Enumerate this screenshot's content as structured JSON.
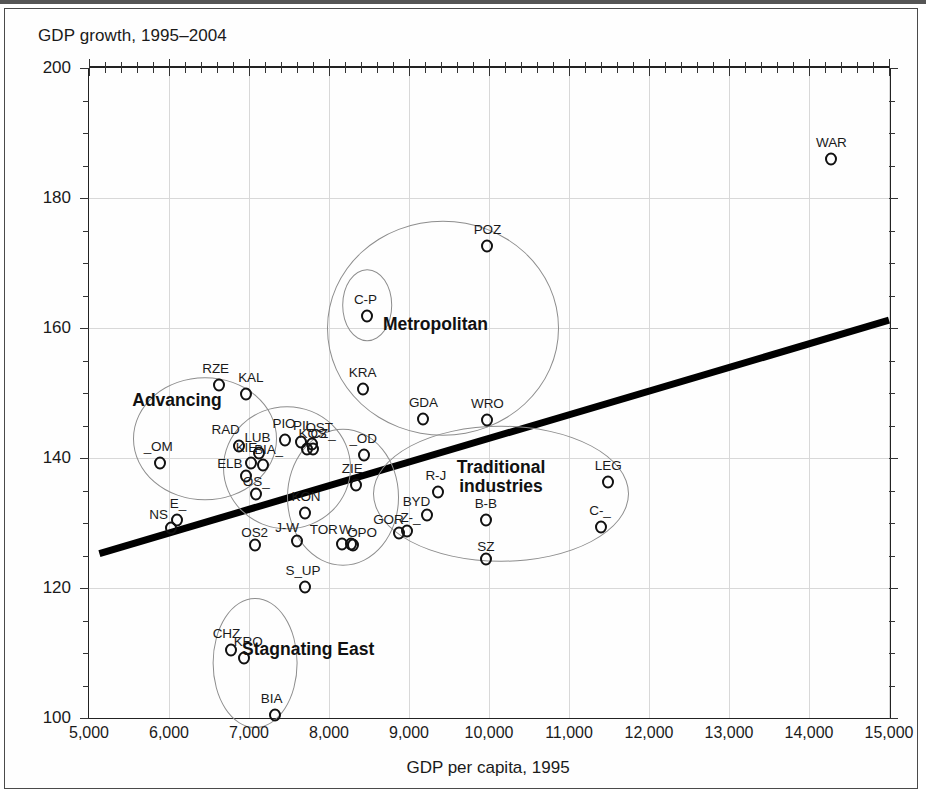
{
  "chart_data": {
    "type": "scatter",
    "title": "GDP growth, 1995–2004",
    "xlabel": "GDP per capita, 1995",
    "ylabel": "GDP growth, 1995–2004",
    "xlim": [
      5000,
      15000
    ],
    "ylim": [
      100,
      200
    ],
    "x_ticks": [
      5000,
      6000,
      7000,
      8000,
      9000,
      10000,
      11000,
      12000,
      13000,
      14000,
      15000
    ],
    "x_tick_labels": [
      "5,000",
      "6,000",
      "7,000",
      "8,000",
      "9,000",
      "10,000",
      "11,000",
      "12,000",
      "13,000",
      "14,000",
      "15,000"
    ],
    "y_ticks": [
      100,
      120,
      140,
      160,
      180,
      200
    ],
    "y_tick_labels": [
      "100",
      "120",
      "140",
      "160",
      "180",
      "200"
    ],
    "x_minor_step": 200,
    "y_minor_step": 5,
    "grid": true,
    "legend": "none",
    "point_color": "#111111",
    "cluster_color": "#8d8d8d",
    "trend_color": "#000000",
    "points": [
      {
        "label": "WAR",
        "x": 14280,
        "y": 186.0,
        "label_dx": 0,
        "label_dy": -9
      },
      {
        "label": "POZ",
        "x": 9980,
        "y": 172.6,
        "label_dx": 0,
        "label_dy": -9
      },
      {
        "label": "C-P",
        "x": 8480,
        "y": 161.8,
        "label_dx": -2,
        "label_dy": -9
      },
      {
        "label": "KRA",
        "x": 8420,
        "y": 150.6,
        "label_dx": 0,
        "label_dy": -9
      },
      {
        "label": "RZE",
        "x": 6620,
        "y": 151.2,
        "label_dx": -3,
        "label_dy": -9
      },
      {
        "label": "KAL",
        "x": 6960,
        "y": 149.8,
        "label_dx": 5,
        "label_dy": -9
      },
      {
        "label": "GDA",
        "x": 9180,
        "y": 146.0,
        "label_dx": 0,
        "label_dy": -9
      },
      {
        "label": "WRO",
        "x": 9980,
        "y": 145.8,
        "label_dx": 0,
        "label_dy": -9
      },
      {
        "label": "RAD",
        "x": 6870,
        "y": 141.8,
        "label_dx": -13,
        "label_dy": -9
      },
      {
        "label": "PIO",
        "x": 7450,
        "y": 142.7,
        "label_dx": -1,
        "label_dy": -9
      },
      {
        "label": "PIL",
        "x": 7650,
        "y": 142.4,
        "label_dx": 2,
        "label_dy": -9
      },
      {
        "label": "OST",
        "x": 7790,
        "y": 142.2,
        "label_dx": 7,
        "label_dy": -9
      },
      {
        "label": "KOS",
        "x": 7720,
        "y": 141.4,
        "label_dx": 6,
        "label_dy": -8
      },
      {
        "label": "CZ_",
        "x": 7800,
        "y": 141.4,
        "label_dx": 10,
        "label_dy": -8
      },
      {
        "label": "_OD",
        "x": 8440,
        "y": 140.4,
        "label_dx": -1,
        "label_dy": -9
      },
      {
        "label": "LUB",
        "x": 7130,
        "y": 140.7,
        "label_dx": -2,
        "label_dy": -8
      },
      {
        "label": "KIE",
        "x": 7030,
        "y": 139.2,
        "label_dx": -5,
        "label_dy": -8
      },
      {
        "label": "BIA_",
        "x": 7170,
        "y": 139.0,
        "label_dx": 6,
        "label_dy": -8
      },
      {
        "label": "_OM",
        "x": 5890,
        "y": 139.3,
        "label_dx": -2,
        "label_dy": -9
      },
      {
        "label": "LEG",
        "x": 11490,
        "y": 136.3,
        "label_dx": 0,
        "label_dy": -9
      },
      {
        "label": "ELB",
        "x": 6960,
        "y": 137.2,
        "label_dx": -16,
        "label_dy": -5
      },
      {
        "label": "ZIE",
        "x": 8340,
        "y": 135.8,
        "label_dx": -4,
        "label_dy": -9
      },
      {
        "label": "R-J",
        "x": 9360,
        "y": 134.7,
        "label_dx": -2,
        "label_dy": -9
      },
      {
        "label": "OS_",
        "x": 7090,
        "y": 134.4,
        "label_dx": 0,
        "label_dy": -5
      },
      {
        "label": "KON",
        "x": 7700,
        "y": 131.5,
        "label_dx": 1,
        "label_dy": -9
      },
      {
        "label": "BYD",
        "x": 9230,
        "y": 131.2,
        "label_dx": -11,
        "label_dy": -6
      },
      {
        "label": "B-B",
        "x": 9960,
        "y": 130.5,
        "label_dx": 0,
        "label_dy": -9
      },
      {
        "label": "C-_",
        "x": 11400,
        "y": 129.4,
        "label_dx": -1,
        "label_dy": -9
      },
      {
        "label": "E_",
        "x": 6100,
        "y": 130.5,
        "label_dx": 1,
        "label_dy": -9
      },
      {
        "label": "NS",
        "x": 6020,
        "y": 129.3,
        "label_dx": -12,
        "label_dy": -6
      },
      {
        "label": "GOR",
        "x": 8880,
        "y": 128.5,
        "label_dx": -11,
        "label_dy": -6
      },
      {
        "label": "Z-_",
        "x": 8980,
        "y": 128.8,
        "label_dx": 3,
        "label_dy": -6
      },
      {
        "label": "J-W",
        "x": 7600,
        "y": 127.3,
        "label_dx": -10,
        "label_dy": -6
      },
      {
        "label": "TOR",
        "x": 8160,
        "y": 126.8,
        "label_dx": -18,
        "label_dy": -7
      },
      {
        "label": "W-",
        "x": 8280,
        "y": 126.8,
        "label_dx": -4,
        "label_dy": -7
      },
      {
        "label": "OPO",
        "x": 8300,
        "y": 126.6,
        "label_dx": 9,
        "label_dy": -5
      },
      {
        "label": "OS2",
        "x": 7070,
        "y": 126.6,
        "label_dx": 0,
        "label_dy": -5
      },
      {
        "label": "SZ",
        "x": 9960,
        "y": 124.5,
        "label_dx": 0,
        "label_dy": -5
      },
      {
        "label": "S_UP",
        "x": 7700,
        "y": 120.2,
        "label_dx": -2,
        "label_dy": -9
      },
      {
        "label": "CHZ",
        "x": 6780,
        "y": 110.4,
        "label_dx": -5,
        "label_dy": -9
      },
      {
        "label": "KRO",
        "x": 6940,
        "y": 109.3,
        "label_dx": 4,
        "label_dy": -9
      },
      {
        "label": "BIA",
        "x": 7320,
        "y": 100.4,
        "label_dx": -3,
        "label_dy": -9
      }
    ],
    "clusters": [
      {
        "name": "Advancing",
        "label": "Advancing",
        "cx": 6450,
        "cy": 143.0,
        "rx": 900,
        "ry": 9.5,
        "label_x": 6100,
        "label_y": 148.8,
        "label_lines": [
          "Advancing"
        ]
      },
      {
        "name": "Metropolitan",
        "label": "Metropolitan",
        "cx": 9430,
        "cy": 160.0,
        "rx": 1450,
        "ry": 16.5,
        "label_x": 9330,
        "label_y": 160.4,
        "label_lines": [
          "Metropolitan"
        ]
      },
      {
        "name": "Capital-Poznan",
        "label": "",
        "cx": 8480,
        "cy": 163.5,
        "rx": 310,
        "ry": 5.5,
        "label_x": 0,
        "label_y": 0,
        "label_lines": []
      },
      {
        "name": "Central",
        "label": "",
        "cx": 7480,
        "cy": 138.5,
        "rx": 800,
        "ry": 9.5,
        "label_x": 0,
        "label_y": 0,
        "label_lines": []
      },
      {
        "name": "Central-Right",
        "label": "",
        "cx": 8180,
        "cy": 134.0,
        "rx": 700,
        "ry": 10.5,
        "label_x": 0,
        "label_y": 0,
        "label_lines": []
      },
      {
        "name": "Traditional industries",
        "label": "Traditional industries",
        "cx": 10150,
        "cy": 134.5,
        "rx": 1600,
        "ry": 10.5,
        "label_x": 10150,
        "label_y": 137.0,
        "label_lines": [
          "Traditional",
          "industries"
        ]
      },
      {
        "name": "Stagnating East",
        "label": "Stagnating East",
        "cx": 7080,
        "cy": 108.5,
        "rx": 530,
        "ry": 10.0,
        "label_x": 7740,
        "label_y": 110.5,
        "label_lines": [
          "Stagnating East"
        ]
      }
    ],
    "trend_line": {
      "x1": 5130,
      "y1": 125.3,
      "x2": 15000,
      "y2": 161.2,
      "width_px": 7
    }
  }
}
